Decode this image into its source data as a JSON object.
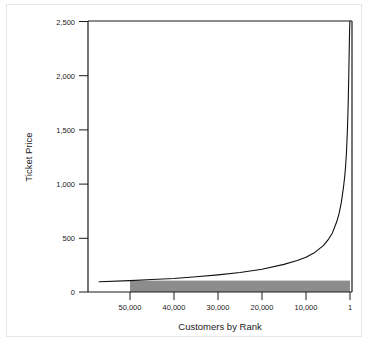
{
  "chart_data": {
    "type": "line",
    "title": "",
    "subtitle": "",
    "xlabel": "Customers by Rank",
    "ylabel": "Ticket Price",
    "grid": false,
    "legend": "none",
    "x_axis": {
      "label": "Customers by Rank",
      "tick_labels": [
        "50,000",
        "40,000",
        "30,000",
        "20,000",
        "10,000",
        "1"
      ],
      "tick_values": [
        50000,
        40000,
        30000,
        20000,
        10000,
        1
      ],
      "direction": "descending-rank-left-to-right",
      "xlim": [
        57000,
        1
      ]
    },
    "y_axis": {
      "label": "Ticket Price",
      "tick_labels": [
        "0",
        "500",
        "1,000",
        "1,500",
        "2,000",
        "2,500"
      ],
      "tick_values": [
        0,
        500,
        1000,
        1500,
        2000,
        2500
      ],
      "ylim": [
        0,
        2500
      ]
    },
    "series": [
      {
        "name": "Demand curve (willingness to pay)",
        "type": "line",
        "color": "#111111",
        "x": [
          57000,
          50000,
          45000,
          40000,
          35000,
          30000,
          25000,
          20000,
          15000,
          12000,
          10000,
          8000,
          6000,
          5000,
          4000,
          3000,
          2500,
          2000,
          1500,
          1200,
          1000,
          800,
          600,
          500,
          400,
          300,
          200,
          150,
          100,
          60,
          30,
          15,
          5,
          1
        ],
        "y": [
          95,
          105,
          115,
          125,
          140,
          158,
          180,
          210,
          255,
          290,
          320,
          365,
          430,
          480,
          545,
          650,
          720,
          820,
          960,
          1065,
          1160,
          1290,
          1480,
          1610,
          1760,
          1960,
          2180,
          2300,
          2400,
          2460,
          2490,
          2498,
          2500,
          2500
        ]
      }
    ],
    "annotations": [
      {
        "name": "shaded-revenue-region",
        "type": "filled-rect",
        "color": "#8c8c8c",
        "x_from": 50000,
        "x_to": 1,
        "y_from": 0,
        "y_to": 105,
        "description": "Grey shaded band representing revenue at the uniform market-clearing price"
      }
    ]
  },
  "axes": {
    "y_ticks": [
      {
        "label": "2,500",
        "value": 2500
      },
      {
        "label": "2,000",
        "value": 2000
      },
      {
        "label": "1,500",
        "value": 1500
      },
      {
        "label": "1,000",
        "value": 1000
      },
      {
        "label": "500",
        "value": 500
      },
      {
        "label": "0",
        "value": 0
      }
    ],
    "x_ticks": [
      {
        "label": "50,000",
        "value": 50000
      },
      {
        "label": "40,000",
        "value": 40000
      },
      {
        "label": "30,000",
        "value": 30000
      },
      {
        "label": "20,000",
        "value": 20000
      },
      {
        "label": "10,000",
        "value": 10000
      },
      {
        "label": "1",
        "value": 1
      }
    ],
    "y_title": "Ticket Price",
    "x_title": "Customers by Rank"
  },
  "colors": {
    "curve": "#111111",
    "axis": "#1a1a1a",
    "shaded_band": "#8c8c8c",
    "background": "#ffffff",
    "outer_frame": "#e6e6e6"
  }
}
